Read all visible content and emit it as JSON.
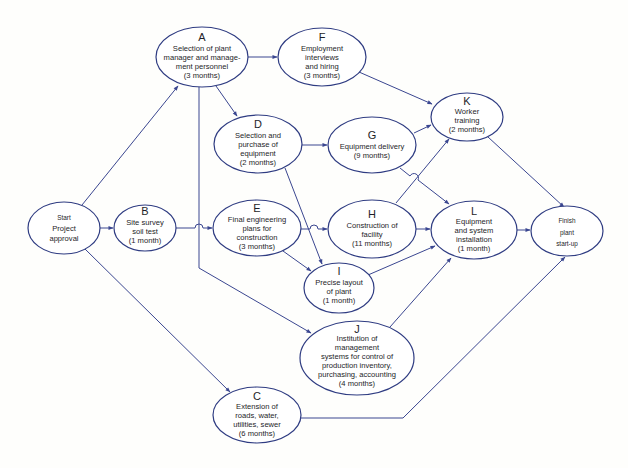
{
  "diagram": {
    "type": "network-diagram",
    "colors": {
      "line": "#3a4690",
      "ellipse_stroke": "#2f3c82",
      "text": "#1e1e28",
      "background": "#fefefc"
    },
    "nodes": {
      "start": {
        "letter": "",
        "lines": [
          "Start",
          "Project",
          "approval"
        ]
      },
      "A": {
        "letter": "A",
        "lines": [
          "Selection of plant",
          "manager and manage-",
          "ment personnel",
          "(3 months)"
        ]
      },
      "B": {
        "letter": "B",
        "lines": [
          "Site survey",
          "soil test",
          "(1 month)"
        ]
      },
      "C": {
        "letter": "C",
        "lines": [
          "Extension of",
          "roads, water,",
          "utilities, sewer",
          "(6 months)"
        ]
      },
      "D": {
        "letter": "D",
        "lines": [
          "Selection and",
          "purchase of",
          "equipment",
          "(2 months)"
        ]
      },
      "E": {
        "letter": "E",
        "lines": [
          "Final engineering",
          "plans for",
          "construction",
          "(3 months)"
        ]
      },
      "F": {
        "letter": "F",
        "lines": [
          "Employment",
          "interviews",
          "and hiring",
          "(3 months)"
        ]
      },
      "G": {
        "letter": "G",
        "lines": [
          "Equipment delivery",
          "(9 months)"
        ]
      },
      "H": {
        "letter": "H",
        "lines": [
          "Construction of",
          "facility",
          "(11 months)"
        ]
      },
      "I": {
        "letter": "I",
        "lines": [
          "Precise layout",
          "of plant",
          "(1 month)"
        ]
      },
      "J": {
        "letter": "J",
        "lines": [
          "Institution of",
          "management",
          "systems for control of",
          "production inventory,",
          "purchasing, accounting",
          "(4 months)"
        ]
      },
      "K": {
        "letter": "K",
        "lines": [
          "Worker",
          "training",
          "(2 months)"
        ]
      },
      "L": {
        "letter": "L",
        "lines": [
          "Equipment",
          "and system",
          "installation",
          "(1 month)"
        ]
      },
      "finish": {
        "letter": "",
        "lines": [
          "Finish",
          "plant",
          "start-up"
        ]
      }
    },
    "edges": [
      [
        "start",
        "A"
      ],
      [
        "start",
        "B"
      ],
      [
        "start",
        "C"
      ],
      [
        "A",
        "F"
      ],
      [
        "A",
        "D"
      ],
      [
        "A",
        "J"
      ],
      [
        "B",
        "E"
      ],
      [
        "D",
        "G"
      ],
      [
        "D",
        "I"
      ],
      [
        "E",
        "H"
      ],
      [
        "E",
        "I"
      ],
      [
        "F",
        "K"
      ],
      [
        "G",
        "K"
      ],
      [
        "G",
        "L"
      ],
      [
        "H",
        "K"
      ],
      [
        "H",
        "L"
      ],
      [
        "I",
        "L"
      ],
      [
        "J",
        "L"
      ],
      [
        "K",
        "finish"
      ],
      [
        "L",
        "finish"
      ],
      [
        "C",
        "finish"
      ]
    ]
  }
}
